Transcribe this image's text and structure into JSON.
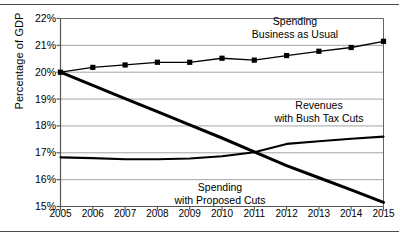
{
  "chart_data": {
    "type": "line",
    "title": "",
    "xlabel": "",
    "ylabel": "Percentage of GDP",
    "x": [
      2005,
      2006,
      2007,
      2008,
      2009,
      2010,
      2011,
      2012,
      2013,
      2014,
      2015
    ],
    "xtick_labels": [
      "2005",
      "2006",
      "2007",
      "2008",
      "2009",
      "2010",
      "2011",
      "2012",
      "2013",
      "2014",
      "2015"
    ],
    "ytick_labels": [
      "22%",
      "21%",
      "20%",
      "19%",
      "18%",
      "17%",
      "16%",
      "15%"
    ],
    "ytick_values": [
      22,
      21,
      20,
      19,
      18,
      17,
      16,
      15
    ],
    "ylim": [
      15,
      22
    ],
    "xlim": [
      2005,
      2015
    ],
    "grid": "horizontal",
    "legend": "annotations-inline",
    "series": [
      {
        "name": "Spending Business as Usual",
        "annotation": [
          "Spending",
          "Business as Usual"
        ],
        "marker": "square",
        "line_weight": "thin",
        "color": "#000000",
        "values": [
          20.0,
          20.18,
          20.27,
          20.37,
          20.37,
          20.52,
          20.45,
          20.62,
          20.78,
          20.92,
          21.15
        ]
      },
      {
        "name": "Revenues with Bush Tax Cuts",
        "annotation": [
          "Revenues",
          "with Bush Tax Cuts"
        ],
        "marker": "none",
        "line_weight": "medium",
        "color": "#000000",
        "values": [
          16.83,
          16.8,
          16.76,
          16.76,
          16.79,
          16.87,
          17.02,
          17.33,
          17.43,
          17.52,
          17.6
        ]
      },
      {
        "name": "Spending with Proposed Cuts",
        "annotation": [
          "Spending",
          "with Proposed Cuts"
        ],
        "marker": "none",
        "line_weight": "thick",
        "color": "#000000",
        "values": [
          20.0,
          19.51,
          19.02,
          18.53,
          18.04,
          17.55,
          17.03,
          16.52,
          16.07,
          15.62,
          15.15
        ]
      }
    ]
  },
  "axis": {
    "y_title": "Percentage of GDP"
  }
}
